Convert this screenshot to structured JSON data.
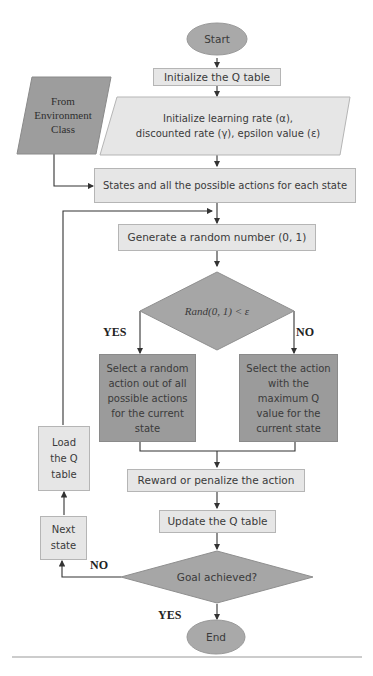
{
  "flowchart": {
    "start": "Start",
    "init_q_table": "Initialize the Q table",
    "env_input": {
      "line1": "From",
      "line2": "Environment",
      "line3": "Class"
    },
    "init_params": {
      "line1": "Initialize learning rate (α),",
      "line2": "discounted rate (γ), epsilon value (ε)"
    },
    "states_actions": "States and all the possible actions for each state",
    "generate_random": "Generate a random number (0, 1)",
    "decision_epsilon": "Rand(0, 1) < ε",
    "yes_label_1": "YES",
    "no_label_1": "NO",
    "explore": {
      "line1": "Select a random",
      "line2": "action out of all",
      "line3": "possible actions",
      "line4": "for the current",
      "line5": "state"
    },
    "exploit": {
      "line1": "Select the action",
      "line2": "with the",
      "line3": "maximum Q",
      "line4": "value for the",
      "line5": "current state"
    },
    "reward": "Reward or penalize the action",
    "update_q_table": "Update the Q table",
    "load_q_table": {
      "line1": "Load",
      "line2": "the Q",
      "line3": "table"
    },
    "next_state": {
      "line1": "Next",
      "line2": "state"
    },
    "decision_goal": "Goal achieved?",
    "no_label_2": "NO",
    "yes_label_2": "YES",
    "end": "End"
  },
  "colors": {
    "light_fill": "#e6e6e6",
    "dark_fill": "#9b9b9b",
    "line": "#333333"
  }
}
